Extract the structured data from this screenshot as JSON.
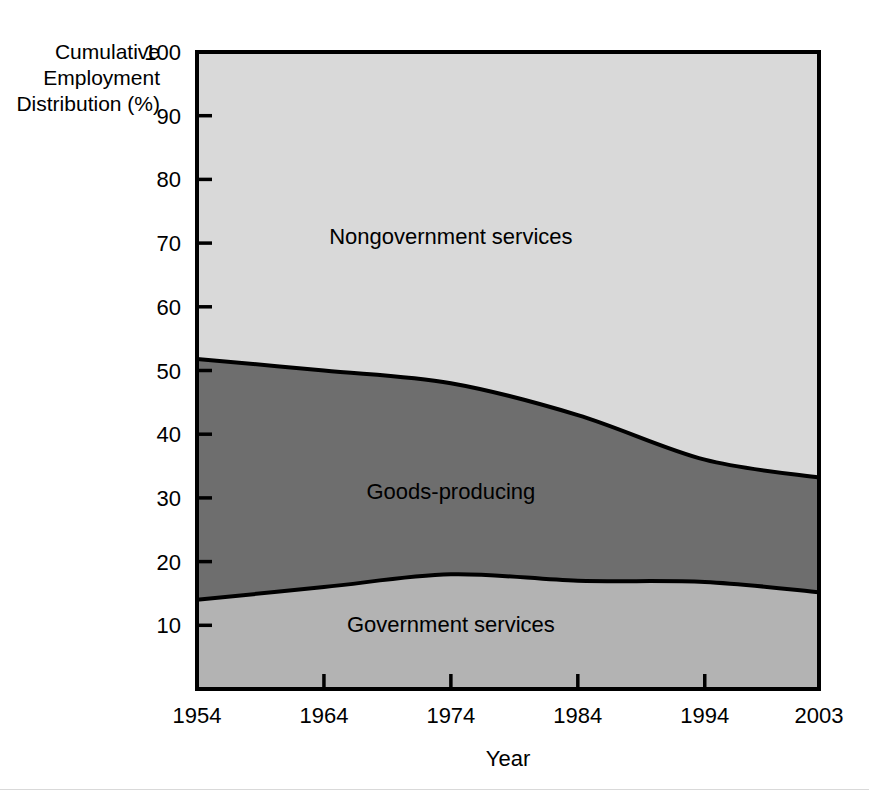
{
  "chart_data": {
    "type": "area",
    "title": "",
    "xlabel": "Year",
    "ylabel": "Cumulative Employment Distribution (%)",
    "ylabel_lines": [
      "Cumulative",
      "Employment",
      "Distribution (%)"
    ],
    "x": [
      1954,
      1964,
      1974,
      1984,
      1994,
      2003
    ],
    "xlim": [
      1954,
      2003
    ],
    "ylim": [
      0,
      100
    ],
    "xticks": [
      1954,
      1964,
      1974,
      1984,
      1994,
      2003
    ],
    "xticklabels": [
      "1954",
      "1964",
      "1974",
      "1984",
      "1994",
      "2003"
    ],
    "yticks": [
      10,
      20,
      30,
      40,
      50,
      60,
      70,
      80,
      90,
      100
    ],
    "yticklabels": [
      "10",
      "20",
      "30",
      "40",
      "50",
      "60",
      "70",
      "80",
      "90",
      "100"
    ],
    "grid": false,
    "legend": "inline-area-labels",
    "stacked": true,
    "series": [
      {
        "name": "Government services",
        "color": "#b3b3b3",
        "label_x": 1974,
        "label_y": 10,
        "values": [
          14.0,
          16.0,
          18.0,
          17.0,
          16.8,
          15.2
        ]
      },
      {
        "name": "Goods-producing",
        "color": "#6e6e6e",
        "label_x": 1974,
        "label_y": 31,
        "values": [
          37.8,
          34.0,
          30.0,
          26.0,
          19.2,
          18.0
        ]
      },
      {
        "name": "Nongovernment services",
        "color": "#d9d9d9",
        "label_x": 1974,
        "label_y": 71,
        "values": [
          48.2,
          50.0,
          52.0,
          57.0,
          64.0,
          66.8
        ]
      }
    ],
    "cumulative_boundaries": {
      "government_services_top": [
        14.0,
        16.0,
        18.0,
        17.0,
        16.8,
        15.2
      ],
      "goods_producing_top": [
        51.8,
        50.0,
        48.0,
        43.0,
        36.0,
        33.2
      ],
      "total_top": [
        100,
        100,
        100,
        100,
        100,
        100
      ]
    }
  },
  "figure": {
    "axis_color": "#000000",
    "background": "#ffffff"
  }
}
